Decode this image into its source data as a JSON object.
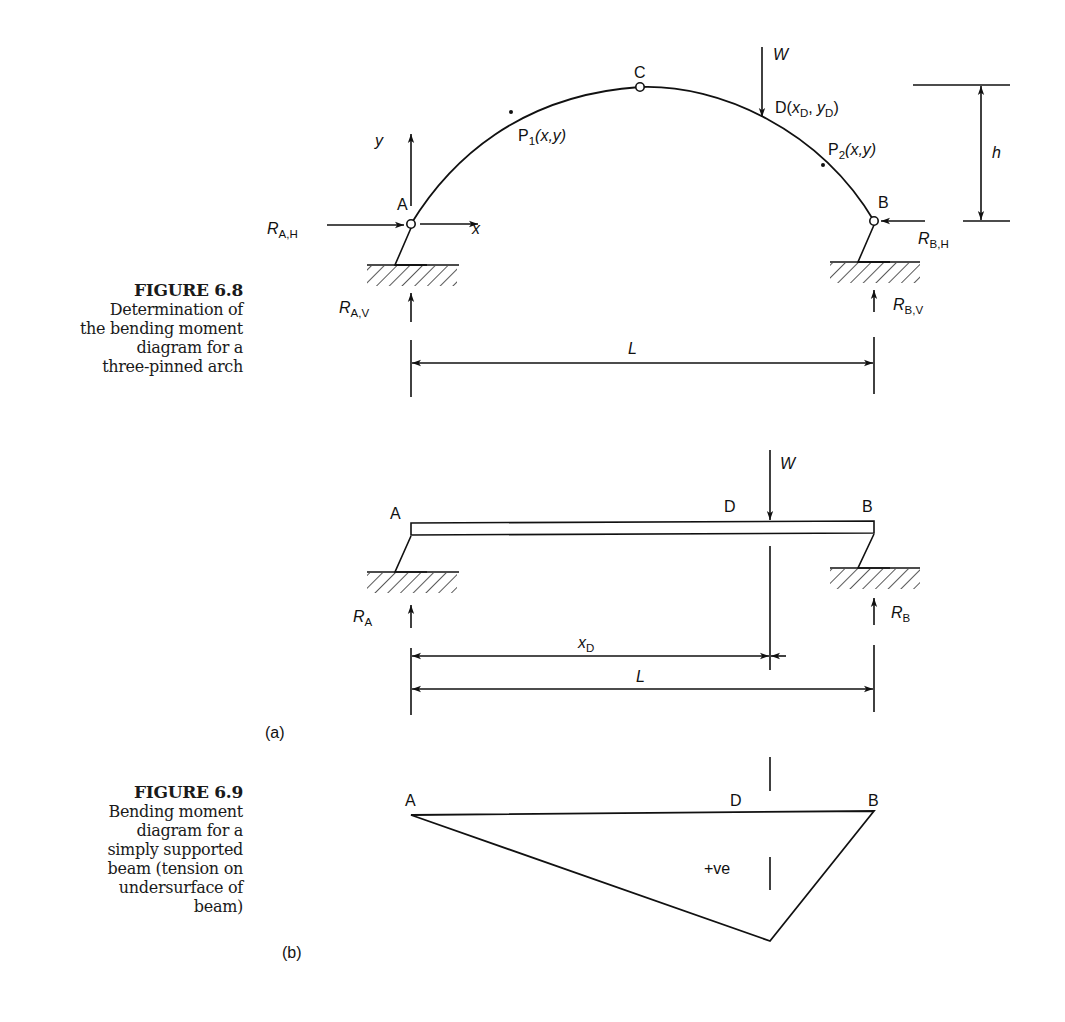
{
  "figure_6_8": {
    "title": "FIGURE 6.8",
    "caption_lines": [
      "Determination of",
      "the bending moment",
      "diagram for a",
      "three-pinned arch"
    ],
    "labels": {
      "A": "A",
      "B": "B",
      "C": "C",
      "W": "W",
      "D": "D(",
      "D_xD": "x",
      "D_sub_x": "D",
      "D_comma": ", ",
      "D_yD": "y",
      "D_sub_y": "D",
      "D_close": ")",
      "P1": "P",
      "P1_sub": "1",
      "P1_coords": "(x,y)",
      "P2": "P",
      "P2_sub": "2",
      "P2_coords": "(x,y)",
      "y_axis": "y",
      "x_axis": "x",
      "h": "h",
      "L": "L",
      "RAH": "R",
      "RAH_sub": "A,H",
      "RAV": "R",
      "RAV_sub": "A,V",
      "RBH": "R",
      "RBH_sub": "B,H",
      "RBV": "R",
      "RBV_sub": "B,V"
    }
  },
  "figure_6_9": {
    "title": "FIGURE 6.9",
    "caption_lines": [
      "Bending moment",
      "diagram for a",
      "simply supported",
      "beam (tension on",
      "undersurface of",
      "beam)"
    ],
    "part_a": {
      "tag": "(a)",
      "labels": {
        "A": "A",
        "B": "B",
        "D": "D",
        "W": "W",
        "RA": "R",
        "RA_sub": "A",
        "RB": "R",
        "RB_sub": "B",
        "xD": "x",
        "xD_sub": "D",
        "L": "L"
      }
    },
    "part_b": {
      "tag": "(b)",
      "labels": {
        "A": "A",
        "B": "B",
        "D": "D",
        "sign": "+ve"
      }
    }
  }
}
